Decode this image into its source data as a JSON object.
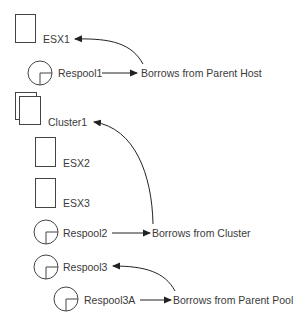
{
  "diagram": {
    "type": "resource-hierarchy",
    "nodes": [
      {
        "id": "esx1",
        "label": "ESX1",
        "kind": "host"
      },
      {
        "id": "respool1",
        "label": "Respool1",
        "kind": "resource-pool"
      },
      {
        "id": "cluster1",
        "label": "Cluster1",
        "kind": "cluster"
      },
      {
        "id": "esx2",
        "label": "ESX2",
        "kind": "host"
      },
      {
        "id": "esx3",
        "label": "ESX3",
        "kind": "host"
      },
      {
        "id": "respool2",
        "label": "Respool2",
        "kind": "resource-pool"
      },
      {
        "id": "respool3",
        "label": "Respool3",
        "kind": "resource-pool"
      },
      {
        "id": "respool3a",
        "label": "Respool3A",
        "kind": "resource-pool"
      }
    ],
    "annotations": [
      {
        "id": "note1",
        "label": "Borrows from Parent Host",
        "from": "respool1",
        "to": "esx1"
      },
      {
        "id": "note2",
        "label": "Borrows from Cluster",
        "from": "respool2",
        "to": "cluster1"
      },
      {
        "id": "note3",
        "label": "Borrows from Parent Pool",
        "from": "respool3a",
        "to": "respool3"
      }
    ],
    "colors": {
      "stroke": "#333333",
      "text": "#3a3a3a",
      "background": "#ffffff"
    }
  }
}
